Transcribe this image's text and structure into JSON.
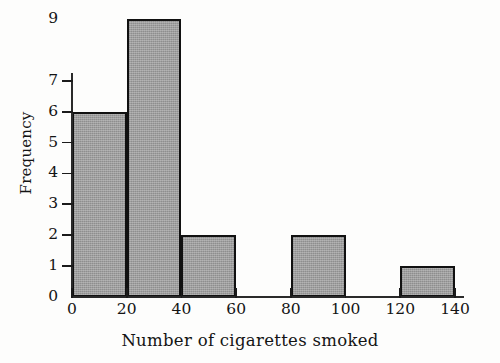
{
  "chart_data": {
    "type": "bar",
    "title": "",
    "subtitle": "",
    "xlabel": "Number of cigarettes smoked",
    "ylabel": "Frequency",
    "categories": [
      "0-20",
      "20-40",
      "40-60",
      "60-80",
      "80-100",
      "100-120",
      "120-140"
    ],
    "bin_edges": [
      0,
      20,
      40,
      60,
      80,
      100,
      120,
      140
    ],
    "bin_width": 20,
    "values": [
      6,
      9,
      2,
      0,
      2,
      0,
      1
    ],
    "xlim": [
      0,
      140
    ],
    "ylim": [
      0,
      9
    ],
    "xticks": [
      0,
      20,
      40,
      60,
      80,
      100,
      120,
      140
    ],
    "xtick_labels": [
      "0",
      "20",
      "40",
      "60",
      "80",
      "100",
      "120",
      "140"
    ],
    "yticks": [
      0,
      1,
      2,
      3,
      4,
      5,
      6,
      7,
      9
    ],
    "ytick_labels": [
      "0",
      "1",
      "2",
      "3",
      "4",
      "5",
      "6",
      "7",
      "9"
    ],
    "grid": false,
    "legend": null,
    "bar_fill_color": "#9e9e9e",
    "bar_edge_color": "#111111",
    "axis_color": "#2a2a2a",
    "background_color": "#fdfdfc"
  }
}
